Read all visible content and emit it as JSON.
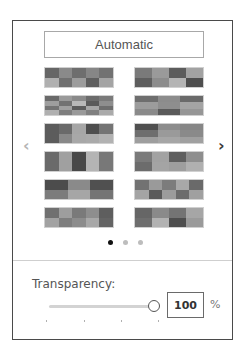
{
  "panel": {
    "automatic_button": {
      "label": "Automatic"
    },
    "navigation": {
      "prev": {
        "glyph": "‹",
        "icon": "chevron-left-icon",
        "enabled": false
      },
      "next": {
        "glyph": "›",
        "icon": "chevron-right-icon",
        "enabled": true
      }
    },
    "palettes": [
      {
        "cols": 5,
        "rows": 2,
        "cells": [
          "#666666",
          "#8a8a8a",
          "#6e6e6e",
          "#868686",
          "#727272",
          "#b0b0b0",
          "#707070",
          "#9c9c9c",
          "#5e5e5e",
          "#a4a4a4"
        ]
      },
      {
        "cols": 4,
        "rows": 2,
        "cells": [
          "#7a7a7a",
          "#9a9a9a",
          "#5c5c5c",
          "#a2a2a2",
          "#5e5e5e",
          "#8c8c8c",
          "#b4b4b4",
          "#4e4e4e"
        ]
      },
      {
        "cols": 5,
        "rows": 4,
        "cells": [
          "#6a6a6a",
          "#9a9a9a",
          "#8a8a8a",
          "#6c6c6c",
          "#7a7a7a",
          "#9e9e9e",
          "#727272",
          "#b8b8b8",
          "#5a5a5a",
          "#8e8e8e",
          "#747474",
          "#a0a0a0",
          "#5c5c5c",
          "#a6a6a6",
          "#6e6e6e",
          "#b0b0b0",
          "#7e7e7e",
          "#9a9a9a",
          "#808080",
          "#aaaaaa"
        ]
      },
      {
        "cols": 3,
        "rows": 3,
        "cells": [
          "#6e6e6e",
          "#8c8c8c",
          "#6a6a6a",
          "#9c9c9c",
          "#8e8e8e",
          "#a4a4a4",
          "#8a8a8a",
          "#5a5a5a",
          "#969696"
        ]
      },
      {
        "cols": 5,
        "rows": 2,
        "cells": [
          "#5c5c5c",
          "#6a6a6a",
          "#a6a6a6",
          "#4e4e4e",
          "#747474",
          "#5c5c5c",
          "#888888",
          "#a8a8a8",
          "#aaaaaa",
          "#b2b2b2"
        ]
      },
      {
        "cols": 3,
        "rows": 3,
        "cells": [
          "#505050",
          "#8c8c8c",
          "#868686",
          "#6e6e6e",
          "#9a9a9a",
          "#8a8a8a",
          "#9e9e9e",
          "#a6a6a6",
          "#a0a0a0"
        ]
      },
      {
        "cols": 5,
        "rows": 1,
        "cells": [
          "#6a6a6a",
          "#a0a0a0",
          "#484848",
          "#b4b4b4",
          "#787878"
        ]
      },
      {
        "cols": 4,
        "rows": 2,
        "cells": [
          "#7a7a7a",
          "#a2a2a2",
          "#5e5e5e",
          "#8e8e8e",
          "#6c6c6c",
          "#a4a4a4",
          "#9e9e9e",
          "#b0b0b0"
        ]
      },
      {
        "cols": 3,
        "rows": 2,
        "cells": [
          "#4c4c4c",
          "#8a8a8a",
          "#505050",
          "#7c7c7c",
          "#a6a6a6",
          "#747474"
        ]
      },
      {
        "cols": 5,
        "rows": 2,
        "cells": [
          "#727272",
          "#9a9a9a",
          "#7c7c7c",
          "#a8a8a8",
          "#6a6a6a",
          "#a4a4a4",
          "#5a5a5a",
          "#9c9c9c",
          "#6c6c6c",
          "#a0a0a0"
        ]
      },
      {
        "cols": 5,
        "rows": 2,
        "cells": [
          "#707070",
          "#9e9e9e",
          "#7a7a7a",
          "#8e8e8e",
          "#5e5e5e",
          "#a2a2a2",
          "#7e7e7e",
          "#8c8c8c",
          "#a8a8a8",
          "#646464"
        ]
      },
      {
        "cols": 4,
        "rows": 2,
        "cells": [
          "#666666",
          "#8a8a8a",
          "#747474",
          "#a6a6a6",
          "#6e6e6e",
          "#b2b2b2",
          "#4e4e4e",
          "#9a9a9a"
        ]
      }
    ],
    "pagination": {
      "pages": 3,
      "current": 0,
      "active_color": "#111111",
      "inactive_color": "#bdbdbd"
    },
    "transparency": {
      "label": "Transparency:",
      "value": "100",
      "unit": "%",
      "slider_percent": 100,
      "tick_count": 4
    }
  }
}
